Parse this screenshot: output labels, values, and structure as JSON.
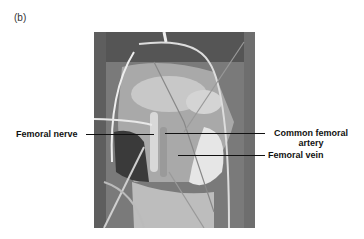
{
  "figure": {
    "panel_label": "(b)",
    "image_description": "Intraoperative photograph of groin dissection with retractors",
    "labels": {
      "femoral_nerve": "Femoral nerve",
      "common_femoral_artery_line1": "Common femoral",
      "common_femoral_artery_line2": "artery",
      "femoral_vein": "Femoral vein"
    }
  }
}
